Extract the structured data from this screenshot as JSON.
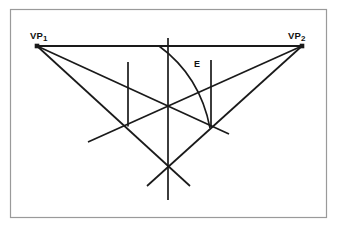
{
  "figure": {
    "background_color": "#ffffff",
    "frame": {
      "name": "figure-border",
      "color": "#9a9a9a",
      "x": 10.5,
      "y": 9.5,
      "width": 316,
      "height": 208
    },
    "line_color": "#1a1a1a",
    "labels": {
      "vp1": {
        "text": "VP",
        "subscript": "1",
        "x": 30,
        "y": 39
      },
      "vp2": {
        "text": "VP",
        "subscript": "2",
        "x": 288,
        "y": 39
      },
      "e": {
        "text": "E",
        "x": 194,
        "y": 67
      }
    },
    "points": {
      "vp1": {
        "name": "vanishing-point-1",
        "x": 37,
        "y": 46
      },
      "vp2": {
        "name": "vanishing-point-2",
        "x": 302,
        "y": 46
      },
      "left_corner": {
        "name": "left-corner-vertex",
        "x": 128,
        "y": 126.5
      },
      "right_corner": {
        "name": "right-corner-vertex",
        "x": 211,
        "y": 127
      },
      "bottom_corner": {
        "name": "bottom-corner-vertex",
        "x": 168,
        "y": 167
      },
      "center_cross": {
        "name": "center-crossing-point",
        "x": 168,
        "y": 107
      },
      "arc_start": {
        "name": "arc-start-point",
        "x": 159,
        "y": 46
      },
      "arc_end": {
        "name": "arc-end-point",
        "x": 210,
        "y": 127
      },
      "e_point": {
        "name": "eye-point-marker",
        "x": 190,
        "y": 64
      }
    },
    "segments": [
      {
        "name": "horizon-line",
        "x1": 37,
        "y1": 46,
        "x2": 302,
        "y2": 46,
        "width": 1.9
      },
      {
        "name": "vp1-to-right-corner",
        "x1": 37,
        "y1": 46,
        "x2": 229,
        "y2": 134,
        "width": 1.7
      },
      {
        "name": "vp1-to-bottom-corner",
        "x1": 37,
        "y1": 46,
        "x2": 190,
        "y2": 186,
        "width": 1.7
      },
      {
        "name": "vp2-to-left-corner",
        "x1": 302,
        "y1": 46,
        "x2": 88,
        "y2": 142,
        "width": 1.7
      },
      {
        "name": "vp2-to-bottom-corner",
        "x1": 302,
        "y1": 46,
        "x2": 147,
        "y2": 186,
        "width": 1.7
      },
      {
        "name": "center-vertical-line",
        "x1": 168,
        "y1": 38,
        "x2": 168,
        "y2": 200,
        "width": 1.7
      },
      {
        "name": "left-vertical-line",
        "x1": 128,
        "y1": 62,
        "x2": 128,
        "y2": 126.5,
        "width": 1.7
      },
      {
        "name": "right-vertical-line",
        "x1": 211,
        "y1": 60,
        "x2": 211,
        "y2": 127,
        "width": 1.7
      }
    ],
    "arc": {
      "name": "measuring-arc",
      "start_x": 159,
      "start_y": 46,
      "end_x": 210,
      "end_y": 128,
      "control_x": 200,
      "control_y": 76,
      "width": 1.6
    },
    "vertex_markers": [
      {
        "name": "vp1-square-marker",
        "x": 37,
        "y": 46,
        "size": 4.5
      },
      {
        "name": "vp2-square-marker",
        "x": 302,
        "y": 46,
        "size": 4.5
      }
    ]
  }
}
